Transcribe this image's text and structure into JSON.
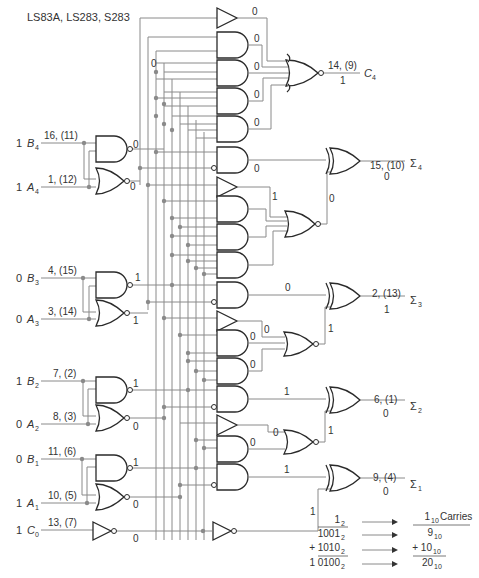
{
  "title": "LS83A, LS283, S283",
  "inputs": [
    {
      "id": "B4",
      "value": "1",
      "name": "B",
      "sub": "4",
      "pins": "16, (11)",
      "y": 143
    },
    {
      "id": "A4",
      "value": "1",
      "name": "A",
      "sub": "4",
      "pins": "1, (12)",
      "y": 187
    },
    {
      "id": "B3",
      "value": "0",
      "name": "B",
      "sub": "3",
      "pins": "4, (15)",
      "y": 278
    },
    {
      "id": "A3",
      "value": "0",
      "name": "A",
      "sub": "3",
      "pins": "3, (14)",
      "y": 319
    },
    {
      "id": "B2",
      "value": "1",
      "name": "B",
      "sub": "2",
      "pins": "7, (2)",
      "y": 381
    },
    {
      "id": "A2",
      "value": "0",
      "name": "A",
      "sub": "2",
      "pins": "8, (3)",
      "y": 424
    },
    {
      "id": "B1",
      "value": "0",
      "name": "B",
      "sub": "1",
      "pins": "11, (6)",
      "y": 459
    },
    {
      "id": "A1",
      "value": "1",
      "name": "A",
      "sub": "1",
      "pins": "10, (5)",
      "y": 503
    },
    {
      "id": "C0",
      "value": "1",
      "name": "C",
      "sub": "0",
      "pins": "13, (7)",
      "y": 530
    }
  ],
  "input_gate_outputs": {
    "nand4": "0",
    "nor4": "0",
    "nand3": "1",
    "nor3": "1",
    "nand2": "1",
    "nor2": "0",
    "nand1": "1",
    "nor1": "0",
    "inv_c0": "0"
  },
  "outputs": [
    {
      "id": "C4",
      "name": "C",
      "sub": "4",
      "pins": "14, (9)",
      "value": "1"
    },
    {
      "id": "S4",
      "name": "Σ",
      "sub": "4",
      "pins": "15, (10)",
      "value": "0"
    },
    {
      "id": "S3",
      "name": "Σ",
      "sub": "3",
      "pins": "2, (13)",
      "value": "1"
    },
    {
      "id": "S2",
      "name": "Σ",
      "sub": "2",
      "pins": "6, (1)",
      "value": "0"
    },
    {
      "id": "S1",
      "name": "Σ",
      "sub": "1",
      "pins": "9, (4)",
      "value": "0"
    }
  ],
  "internal_values": {
    "c4_buf": "0",
    "c4_and1": "0",
    "c4_and2": "0",
    "c4_and3": "0",
    "c4_and4": "0",
    "c4_col_top": "0",
    "s4_and": "0",
    "s4_buf": "1",
    "s4_nor": "0",
    "s3_and": "0",
    "s3_buf": "0",
    "s3_and1": "0",
    "s3_and2": "0",
    "s3_nor": "1",
    "s2_and": "1",
    "s2_buf": "0",
    "s2_and1": "0",
    "s2_nor": "1",
    "s1_and": "1",
    "s1_inv": "1"
  },
  "worked_example": {
    "rows": [
      {
        "binary": "1",
        "binary_sub": "2",
        "decimal": "1",
        "decimal_sub": "10",
        "note": "Carries"
      },
      {
        "binary": "1001",
        "binary_sub": "2",
        "decimal": "9",
        "decimal_sub": "10",
        "note": ""
      },
      {
        "binary": "+ 1010",
        "binary_sub": "2",
        "decimal": "+  10",
        "decimal_sub": "10",
        "note": ""
      },
      {
        "binary": "1 0100",
        "binary_sub": "2",
        "decimal": "20",
        "decimal_sub": "10",
        "note": ""
      }
    ]
  },
  "colors": {
    "wire": "#8a8a8a",
    "gate": "#2a2a2a",
    "text": "#333333"
  }
}
